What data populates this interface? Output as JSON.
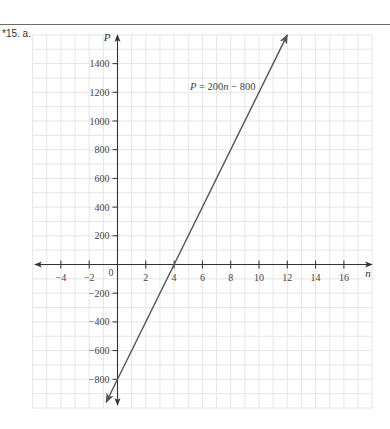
{
  "problem": {
    "label": "*15. a."
  },
  "chart_data": {
    "type": "line",
    "title": "",
    "xlabel": "n",
    "ylabel": "P",
    "xlim": [
      -6,
      18
    ],
    "ylim": [
      -1000,
      1600
    ],
    "grid": true,
    "x_grid_step": 1,
    "y_grid_step": 100,
    "x_ticks": [
      -4,
      -2,
      2,
      4,
      6,
      8,
      10,
      12,
      14,
      16
    ],
    "x_tick_labels": [
      "−4",
      "−2",
      "2",
      "4",
      "6",
      "8",
      "10",
      "12",
      "14",
      "16"
    ],
    "origin_label": "0",
    "y_ticks": [
      1400,
      1200,
      1000,
      800,
      600,
      400,
      200,
      -200,
      -400,
      -600,
      -800
    ],
    "y_tick_labels": [
      "1400",
      "1200",
      "1000",
      "800",
      "600",
      "400",
      "200",
      "−200",
      "−400",
      "−600",
      "−800"
    ],
    "series": [
      {
        "name": "P = 200n − 800",
        "equation": {
          "lhs": "P",
          "rhs_coef": "200",
          "rhs_var": "n",
          "rhs_const": " − 800"
        },
        "slope": 200,
        "intercept": -800,
        "x": [
          -0.8,
          12
        ],
        "values": [
          -960,
          1600
        ],
        "arrows_both_ends": true,
        "label_position": {
          "n": 3.9,
          "P": 1200
        }
      }
    ],
    "annotations": [
      {
        "text": "P = 200n − 800",
        "near": [
          7.5,
          1200
        ]
      }
    ]
  },
  "colors": {
    "grid": "#e6e6e6",
    "axis": "#333333",
    "line": "#555555",
    "text": "#444444"
  }
}
